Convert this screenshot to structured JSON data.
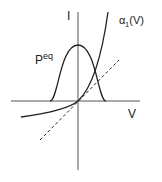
{
  "diagram": {
    "axes": {
      "y_label": "I",
      "x_label": "V"
    },
    "curves": {
      "bell": {
        "label_base": "P",
        "label_sup": "eq"
      },
      "exponential": {
        "label": "α",
        "label_sub": "1",
        "label_tail": "(V)"
      },
      "dashed_line": {
        "style": "dashed"
      }
    },
    "colors": {
      "ink": "#222222",
      "axis": "#555555",
      "background": "#ffffff"
    }
  }
}
